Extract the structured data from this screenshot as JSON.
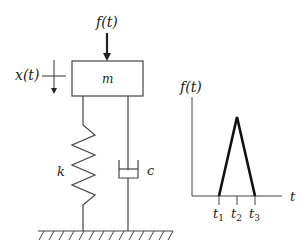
{
  "diagram": {
    "type": "single-degree-of-freedom mass-spring-damper system with triangular pulse force",
    "system": {
      "force_label": "f(t)",
      "mass_label": "m",
      "displacement_label": "x(t)",
      "spring_label": "k",
      "damper_label": "c"
    },
    "pulse_plot": {
      "y_axis_label": "f(t)",
      "x_axis_label": "t",
      "ticks": [
        {
          "main": "t",
          "sub": "1"
        },
        {
          "main": "t",
          "sub": "2"
        },
        {
          "main": "t",
          "sub": "3"
        }
      ],
      "shape": "triangle rising from t1 to peak at t2, falling to zero at t3"
    },
    "colors": {
      "line": "#333333",
      "background": "#ffffff"
    }
  }
}
